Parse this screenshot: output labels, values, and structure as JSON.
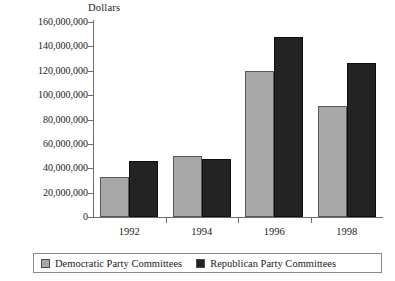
{
  "chart_data": {
    "type": "bar",
    "title": "",
    "xlabel": "",
    "ylabel": "Dollars",
    "categories": [
      "1992",
      "1994",
      "1996",
      "1998"
    ],
    "series": [
      {
        "name": "Democratic Party Committees",
        "color": "#a8a8a8",
        "values": [
          33000000,
          50000000,
          120000000,
          91000000
        ]
      },
      {
        "name": "Republican Party Committees",
        "color": "#232323",
        "values": [
          46000000,
          48000000,
          148000000,
          126000000
        ]
      }
    ],
    "ylim": [
      0,
      160000000
    ],
    "ytick_values": [
      0,
      20000000,
      40000000,
      60000000,
      80000000,
      100000000,
      120000000,
      140000000,
      160000000
    ],
    "ytick_labels": [
      "0",
      "20,000,000",
      "40,000,000",
      "60,000,000",
      "80,000,000",
      "100,000,000",
      "120,000,000",
      "140,000,000",
      "160,000,000"
    ],
    "grid": false,
    "legend_position": "bottom"
  },
  "legend": {
    "entries": [
      {
        "label": "Democratic Party Committees"
      },
      {
        "label": "Republican Party Committees"
      }
    ]
  }
}
